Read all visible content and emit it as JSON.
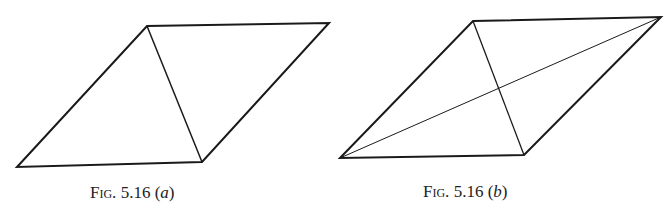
{
  "figures": [
    {
      "id": "a",
      "caption_prefix": "Fig.",
      "caption_number": "5.16",
      "caption_label": "a",
      "vertices": [
        [
          17,
          167
        ],
        [
          147,
          26
        ],
        [
          329,
          23
        ],
        [
          202,
          162
        ]
      ],
      "diagonals": [
        [
          [
            147,
            26
          ],
          [
            202,
            162
          ]
        ]
      ]
    },
    {
      "id": "b",
      "caption_prefix": "Fig.",
      "caption_number": "5.16",
      "caption_label": "b",
      "vertices": [
        [
          340,
          158
        ],
        [
          473,
          21
        ],
        [
          661,
          17
        ],
        [
          524,
          155
        ]
      ],
      "diagonals": [
        [
          [
            473,
            21
          ],
          [
            524,
            155
          ]
        ],
        [
          [
            340,
            158
          ],
          [
            661,
            17
          ]
        ]
      ]
    }
  ]
}
